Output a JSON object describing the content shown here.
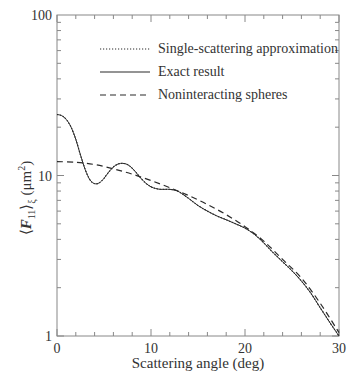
{
  "chart_data": {
    "type": "line",
    "title": "",
    "xlabel": "Scattering angle (deg)",
    "ylabel": "⟨F11⟩ξ (μm²)",
    "ylabel_parts": {
      "open": "⟨",
      "F": "F",
      "sub11": "11",
      "close": "⟩",
      "subxi": "ξ",
      "unit": " (μm",
      "sup": "2",
      "unit_close": ")"
    },
    "xlim": [
      0,
      30
    ],
    "ylim": [
      1,
      100
    ],
    "yscale": "log",
    "grid": false,
    "legend_position": "upper right",
    "x_ticks": [
      0,
      10,
      20,
      30
    ],
    "x_tick_labels": [
      "0",
      "10",
      "20",
      "30"
    ],
    "y_ticks": [
      1,
      10,
      100
    ],
    "y_tick_labels": [
      "1",
      "10",
      "100"
    ],
    "series": [
      {
        "name": "Single-scattering approximation",
        "style": "dotted",
        "x": [
          0,
          0.5,
          1,
          1.5,
          2,
          2.5,
          3,
          3.5,
          4,
          4.5,
          5,
          5.5,
          6,
          6.5,
          7,
          7.5,
          8,
          8.5,
          9,
          9.5,
          10,
          10.5,
          11,
          11.5,
          12,
          12.5,
          13,
          14,
          15,
          16,
          17,
          18,
          19,
          20,
          21,
          22,
          23,
          24,
          25,
          26,
          27,
          28,
          29,
          30
        ],
        "values": [
          24.0,
          23.6,
          22.3,
          20.0,
          16.8,
          13.4,
          10.9,
          9.4,
          8.9,
          9.0,
          9.6,
          10.5,
          11.3,
          11.8,
          11.9,
          11.7,
          11.1,
          10.3,
          9.5,
          8.9,
          8.5,
          8.3,
          8.2,
          8.2,
          8.2,
          8.1,
          7.9,
          7.2,
          6.5,
          6.0,
          5.6,
          5.3,
          5.0,
          4.7,
          4.3,
          3.8,
          3.3,
          2.9,
          2.55,
          2.2,
          1.85,
          1.5,
          1.22,
          1.0
        ]
      },
      {
        "name": "Exact result",
        "style": "solid",
        "x": [
          0,
          0.5,
          1,
          1.5,
          2,
          2.5,
          3,
          3.5,
          4,
          4.5,
          5,
          5.5,
          6,
          6.5,
          7,
          7.5,
          8,
          8.5,
          9,
          9.5,
          10,
          10.5,
          11,
          11.5,
          12,
          12.5,
          13,
          14,
          15,
          16,
          17,
          18,
          19,
          20,
          21,
          22,
          23,
          24,
          25,
          26,
          27,
          28,
          29,
          30
        ],
        "values": [
          24.0,
          23.6,
          22.3,
          20.0,
          16.8,
          13.4,
          10.9,
          9.4,
          8.9,
          9.0,
          9.6,
          10.5,
          11.3,
          11.8,
          11.9,
          11.7,
          11.1,
          10.3,
          9.5,
          8.9,
          8.5,
          8.3,
          8.2,
          8.2,
          8.2,
          8.1,
          7.9,
          7.2,
          6.5,
          6.0,
          5.6,
          5.3,
          5.0,
          4.7,
          4.3,
          3.8,
          3.3,
          2.9,
          2.55,
          2.2,
          1.85,
          1.5,
          1.22,
          1.0
        ]
      },
      {
        "name": "Noninteracting spheres",
        "style": "dashed",
        "x": [
          0,
          2,
          4,
          6,
          8,
          10,
          12,
          14,
          16,
          18,
          20,
          22,
          24,
          26,
          28,
          30
        ],
        "values": [
          12.2,
          12.1,
          11.7,
          11.0,
          10.2,
          9.3,
          8.4,
          7.5,
          6.6,
          5.7,
          4.8,
          3.9,
          3.0,
          2.3,
          1.6,
          1.05
        ]
      }
    ]
  },
  "legend": {
    "items": [
      {
        "label": "Single-scattering approximation",
        "style": "dotted"
      },
      {
        "label": "Exact result",
        "style": "solid"
      },
      {
        "label": "Noninteracting spheres",
        "style": "dashed"
      }
    ]
  },
  "colors": {
    "line": "#2a2a2a",
    "axis": "#888888",
    "text": "#333333"
  }
}
